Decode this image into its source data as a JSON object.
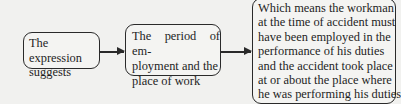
{
  "diagram": {
    "type": "flowchart",
    "nodes": [
      {
        "id": "expression",
        "lines": [
          "The expression",
          "suggests"
        ]
      },
      {
        "id": "period",
        "lines": [
          "The period of em-",
          "ployment and the",
          "place of work"
        ]
      },
      {
        "id": "meaning",
        "lines": [
          "Which means the workman",
          "at the time of accident must",
          "have been employed in the",
          "performance of his duties",
          "and the accident took place",
          "at or about the place where",
          "he was performing his duties"
        ]
      }
    ],
    "edges": [
      {
        "from": "expression",
        "to": "period"
      },
      {
        "from": "period",
        "to": "meaning"
      }
    ],
    "colors": {
      "border": "#2a2a2a",
      "background": "#f1f1ef",
      "text": "#1e1e1e"
    }
  }
}
